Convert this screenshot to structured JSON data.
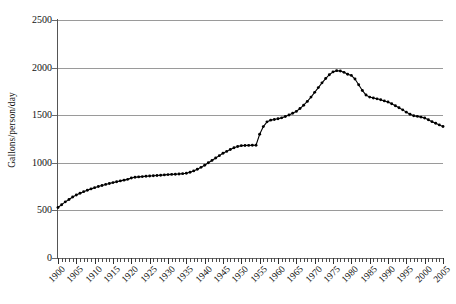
{
  "chart_data": {
    "type": "line",
    "title": "",
    "xlabel": "",
    "ylabel": "Gallons/person/day",
    "xlim": [
      1900,
      2005
    ],
    "ylim": [
      0,
      2500
    ],
    "y_ticks": [
      0,
      500,
      1000,
      1500,
      2000,
      2500
    ],
    "x_ticks": [
      1900,
      1905,
      1910,
      1915,
      1920,
      1925,
      1930,
      1935,
      1940,
      1945,
      1950,
      1955,
      1960,
      1965,
      1970,
      1975,
      1980,
      1985,
      1990,
      1995,
      2000,
      2005
    ],
    "x_minor_tick_step": 1,
    "grid": "horizontal",
    "legend": "none",
    "marker": "small-filled-circle",
    "line_color": "#000000",
    "grid_color": "#9a9a9a",
    "background_color": "#ffffff",
    "x": [
      1900,
      1901,
      1902,
      1903,
      1904,
      1905,
      1906,
      1907,
      1908,
      1909,
      1910,
      1911,
      1912,
      1913,
      1914,
      1915,
      1916,
      1917,
      1918,
      1919,
      1920,
      1921,
      1922,
      1923,
      1924,
      1925,
      1926,
      1927,
      1928,
      1929,
      1930,
      1931,
      1932,
      1933,
      1934,
      1935,
      1936,
      1937,
      1938,
      1939,
      1940,
      1941,
      1942,
      1943,
      1944,
      1945,
      1946,
      1947,
      1948,
      1949,
      1950,
      1951,
      1952,
      1953,
      1954,
      1955,
      1956,
      1957,
      1958,
      1959,
      1960,
      1961,
      1962,
      1963,
      1964,
      1965,
      1966,
      1967,
      1968,
      1969,
      1970,
      1971,
      1972,
      1973,
      1974,
      1975,
      1976,
      1977,
      1978,
      1979,
      1980,
      1981,
      1982,
      1983,
      1984,
      1985,
      1986,
      1987,
      1988,
      1989,
      1990,
      1991,
      1992,
      1993,
      1994,
      1995,
      1996,
      1997,
      1998,
      1999,
      2000,
      2001,
      2002,
      2003,
      2004,
      2005
    ],
    "values": [
      530,
      560,
      590,
      615,
      640,
      662,
      680,
      697,
      712,
      726,
      739,
      751,
      762,
      773,
      783,
      792,
      801,
      810,
      818,
      826,
      840,
      848,
      852,
      855,
      858,
      861,
      864,
      867,
      870,
      873,
      876,
      878,
      880,
      883,
      886,
      890,
      900,
      915,
      932,
      952,
      975,
      1000,
      1025,
      1050,
      1075,
      1100,
      1120,
      1140,
      1158,
      1172,
      1180,
      1182,
      1183,
      1184,
      1185,
      1300,
      1380,
      1430,
      1448,
      1455,
      1462,
      1472,
      1486,
      1502,
      1520,
      1540,
      1570,
      1605,
      1645,
      1690,
      1740,
      1790,
      1840,
      1885,
      1925,
      1955,
      1968,
      1965,
      1950,
      1930,
      1918,
      1880,
      1820,
      1760,
      1712,
      1690,
      1680,
      1672,
      1662,
      1650,
      1638,
      1620,
      1600,
      1578,
      1556,
      1532,
      1510,
      1495,
      1488,
      1480,
      1470,
      1452,
      1432,
      1415,
      1398,
      1382
    ]
  }
}
